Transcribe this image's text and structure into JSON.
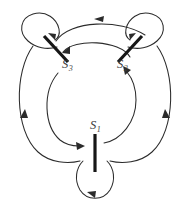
{
  "figure": {
    "type": "state-transition-diagram",
    "background_color": "#ffffff",
    "line_color": "#2b2b2b",
    "state_bar_color": "#161616",
    "label_color": "#3a3a3a",
    "width": 190,
    "height": 214
  },
  "states": [
    {
      "id": "S1",
      "label_base": "S",
      "label_sub": "1",
      "label_full": "S1",
      "x": 96,
      "y": 127,
      "marker": "vertical-bar",
      "position": "bottom"
    },
    {
      "id": "S2",
      "label_base": "S",
      "label_sub": "2",
      "label_full": "S2",
      "x": 122,
      "y": 64,
      "marker": "diagonal-bar-up-right",
      "position": "top-right"
    },
    {
      "id": "S3",
      "label_base": "S",
      "label_sub": "3",
      "label_full": "S3",
      "x": 62,
      "y": 64,
      "marker": "diagonal-bar-down-right",
      "position": "top-left"
    }
  ],
  "transitions": [
    {
      "id": "self-loop-s3",
      "from": "S3",
      "to": "S3",
      "shape": "self-loop",
      "side": "top-left",
      "arrow_direction": "into-state"
    },
    {
      "id": "self-loop-s2",
      "from": "S2",
      "to": "S2",
      "shape": "self-loop",
      "side": "top-right",
      "arrow_direction": "into-state"
    },
    {
      "id": "self-loop-s1",
      "from": "S1",
      "to": "S1",
      "shape": "self-loop",
      "side": "bottom",
      "arrow_direction": "into-state"
    },
    {
      "id": "outer-s3-to-s2",
      "from": "S3",
      "to": "S2",
      "shape": "outer-arc",
      "arrow_direction": "rightward-top"
    },
    {
      "id": "outer-s2-to-s1",
      "from": "S2",
      "to": "S1",
      "shape": "outer-arc",
      "arrow_direction": "downward-right"
    },
    {
      "id": "outer-s1-to-s3",
      "from": "S1",
      "to": "S3",
      "shape": "outer-arc",
      "arrow_direction": "downward-left"
    },
    {
      "id": "inner-s2-to-s3",
      "from": "S2",
      "to": "S3",
      "shape": "inner-arc",
      "arrow_direction": "leftward-top"
    },
    {
      "id": "inner-s3-to-s1",
      "from": "S3",
      "to": "S1",
      "shape": "inner-arc",
      "arrow_direction": "rightward-bottom"
    },
    {
      "id": "inner-s1-to-s2",
      "from": "S1",
      "to": "S2",
      "shape": "inner-arc",
      "arrow_direction": "upward-right"
    }
  ]
}
